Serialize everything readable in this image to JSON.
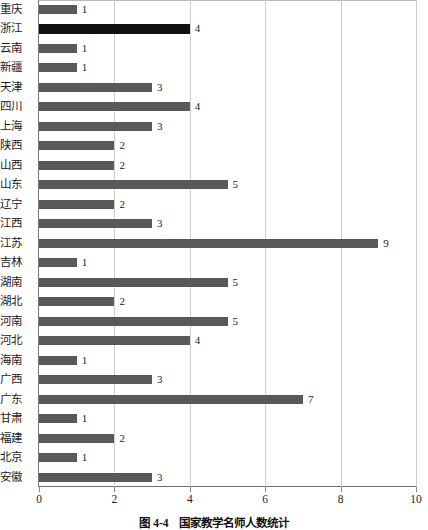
{
  "caption": {
    "number": "图 4-4",
    "text": "国家教学名师人数统计"
  },
  "chart_data": {
    "type": "bar",
    "orientation": "horizontal",
    "title": "国家教学名师人数统计",
    "xlabel": "",
    "ylabel": "",
    "xlim": [
      0,
      10
    ],
    "xticks": [
      0,
      2,
      4,
      6,
      8,
      10
    ],
    "grid": true,
    "gridlines_at": [
      2,
      4,
      6,
      8,
      10
    ],
    "legend": null,
    "highlight_category": "浙江",
    "colors": {
      "bar": "#595959",
      "highlight_bar": "#111111",
      "grid": "#cfcfcf",
      "frame": "#7a7a7a",
      "text": "#1b1b1b",
      "background": "#ffffff"
    },
    "categories": [
      "重庆",
      "浙江",
      "云南",
      "新疆",
      "天津",
      "四川",
      "上海",
      "陕西",
      "山西",
      "山东",
      "辽宁",
      "江西",
      "江苏",
      "吉林",
      "湖南",
      "湖北",
      "河南",
      "河北",
      "海南",
      "广西",
      "广东",
      "甘肃",
      "福建",
      "北京",
      "安徽"
    ],
    "values": [
      1,
      4,
      1,
      1,
      3,
      4,
      3,
      2,
      2,
      5,
      2,
      3,
      9,
      1,
      5,
      2,
      5,
      4,
      1,
      3,
      7,
      1,
      2,
      1,
      3
    ],
    "data_labels": [
      "1",
      "4",
      "1",
      "1",
      "3",
      "4",
      "3",
      "2",
      "2",
      "5",
      "2",
      "3",
      "9",
      "1",
      "5",
      "2",
      "5",
      "4",
      "1",
      "3",
      "7",
      "1",
      "2",
      "1",
      "3"
    ]
  }
}
